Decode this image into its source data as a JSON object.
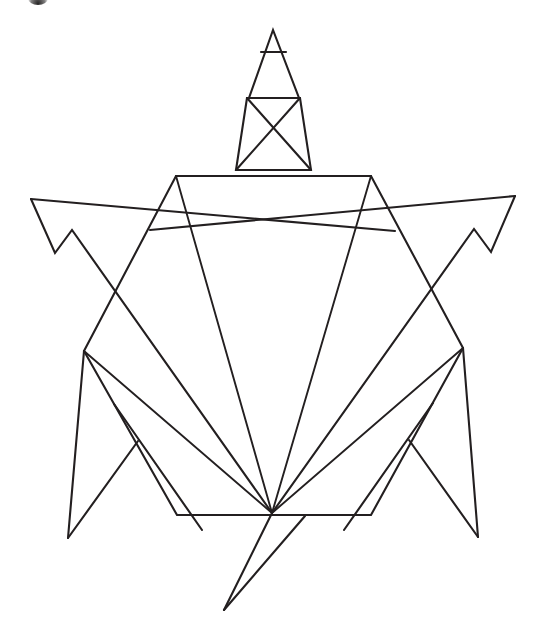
{
  "document": {
    "title": "Origami Turtle Line Drawing",
    "background_color": "#ffffff",
    "line_color": "#231f20",
    "width": 540,
    "height": 644
  },
  "figure": {
    "name": "origami-turtle",
    "stroke_width": 2.1,
    "parts": [
      {
        "id": "head-tip",
        "label": "Head tip triangle"
      },
      {
        "id": "head-band",
        "label": "Head crossbar"
      },
      {
        "id": "head-body",
        "label": "Head triangle"
      },
      {
        "id": "neck",
        "label": "Neck trapezoid"
      },
      {
        "id": "neck-cross",
        "label": "Neck X crease"
      },
      {
        "id": "shell",
        "label": "Shell hexagon"
      },
      {
        "id": "shell-creases",
        "label": "Shell radiating creases"
      },
      {
        "id": "flipper-left",
        "label": "Left front flipper"
      },
      {
        "id": "flipper-right",
        "label": "Right front flipper"
      },
      {
        "id": "leg-left",
        "label": "Left rear leg"
      },
      {
        "id": "leg-right",
        "label": "Right rear leg"
      },
      {
        "id": "tail",
        "label": "Tail"
      }
    ]
  },
  "geometry": {
    "head_tip": "M 273,30 L 249,98 L 299,98 Z",
    "head_band": "M 261,52 L 286,52",
    "neck_outline": "M 247,98 L 236,170 L 311,170 L 300,98 Z",
    "neck_cross_a": "M 247,98 L 311,170",
    "neck_cross_b": "M 300,98 L 236,170",
    "shell_outline": "M 176,176 L 371,176 L 463,348 L 371,515 L 177,515 L 84,351 Z",
    "shell_crease_left_top": "M 176,176 L 272,513",
    "shell_crease_right_top": "M 371,176 L 272,513",
    "shell_crease_left_mid": "M 84,351 L 272,513",
    "shell_crease_right_mid": "M 463,348 L 272,513",
    "flipper_left_upper": "M 31,199 L 395,231",
    "flipper_left_lower": "M 31,199 L 55,253 L 72,230 L 272,513",
    "flipper_right_upper": "M 515,196 L 150,230",
    "flipper_right_lower": "M 515,196 L 491,252 L 474,229 L 272,513",
    "leg_left_outer": "M 84,351 L 68,538",
    "leg_left_inner": "M 68,538 L 138,441",
    "leg_left_spine": "M 114,404 L 202,530",
    "leg_right_outer": "M 463,348 L 478,537",
    "leg_right_inner": "M 478,537 L 409,440",
    "leg_right_spine": "M 433,403 L 344,530",
    "tail_left": "M 272,513 L 224,610",
    "tail_right": "M 224,610 L 305,516"
  },
  "corner_mark": {
    "name": "page-corner-mark",
    "visible": true,
    "color": "#141212"
  }
}
